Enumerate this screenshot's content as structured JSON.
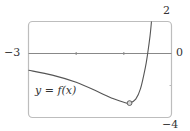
{
  "chart_data": {
    "type": "line",
    "title": "",
    "xlabel": "",
    "ylabel": "",
    "xlim": [
      -3,
      0
    ],
    "ylim": [
      -4,
      2
    ],
    "grid": false,
    "legend": null,
    "axis_labels": {
      "x_min": "−3",
      "x_max": "0",
      "y_max": "2",
      "y_min": "−4"
    },
    "x_ticks": [
      -2,
      -1
    ],
    "series": [
      {
        "name": "y = f(x)",
        "x": [
          -3.0,
          -2.5,
          -2.0,
          -1.5,
          -1.2,
          -1.0,
          -0.88,
          -0.75,
          -0.65,
          -0.55,
          -0.5,
          -0.45,
          -0.42
        ],
        "y": [
          -1.05,
          -1.35,
          -1.8,
          -2.45,
          -2.85,
          -3.05,
          -3.1,
          -2.85,
          -2.2,
          -0.9,
          0.0,
          1.1,
          2.0
        ]
      }
    ],
    "annotations": [
      {
        "text": "y = f(x)",
        "x": -2.55,
        "y": -2.3
      },
      {
        "type": "open-circle-marker",
        "x": -0.88,
        "y": -3.1,
        "meaning": "local minimum"
      }
    ]
  },
  "labels": {
    "x_min": "−3",
    "x_max": "0",
    "y_max": "2",
    "y_min": "−4",
    "function": "y = f(x)"
  }
}
